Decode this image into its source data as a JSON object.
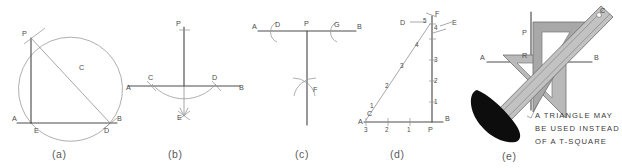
{
  "figure": {
    "title_note": "A TRIANGLE MAY BE USED INSTEAD OF A T-SQUARE",
    "background_color": "#ffffff",
    "line_color": "#4d4d4d",
    "construction_color": "#9a9a9a"
  },
  "panels": [
    {
      "id": "a",
      "caption": "(a)",
      "method": "semicircle-inscribed-right-angle",
      "labels": [
        {
          "key": "P",
          "text": "P"
        },
        {
          "key": "C",
          "text": "C"
        },
        {
          "key": "A",
          "text": "A"
        },
        {
          "key": "E",
          "text": "E"
        },
        {
          "key": "D",
          "text": "D"
        },
        {
          "key": "B",
          "text": "B"
        }
      ]
    },
    {
      "id": "b",
      "caption": "(b)",
      "method": "arc-bisector-through-point",
      "labels": [
        {
          "key": "P",
          "text": "P"
        },
        {
          "key": "A",
          "text": "A"
        },
        {
          "key": "C",
          "text": "C"
        },
        {
          "key": "D",
          "text": "D"
        },
        {
          "key": "B",
          "text": "B"
        },
        {
          "key": "E",
          "text": "E"
        }
      ]
    },
    {
      "id": "c",
      "caption": "(c)",
      "method": "equal-arcs-perpendicular-at-point",
      "labels": [
        {
          "key": "A",
          "text": "A"
        },
        {
          "key": "D",
          "text": "D"
        },
        {
          "key": "P",
          "text": "P"
        },
        {
          "key": "G",
          "text": "G"
        },
        {
          "key": "B",
          "text": "B"
        },
        {
          "key": "F",
          "text": "F"
        }
      ]
    },
    {
      "id": "d",
      "caption": "(d)",
      "method": "3-4-5-triangle-units",
      "labels": [
        {
          "key": "F",
          "text": "F"
        },
        {
          "key": "D",
          "text": "D"
        },
        {
          "key": "E",
          "text": "E"
        },
        {
          "key": "A",
          "text": "A"
        },
        {
          "key": "C",
          "text": "C"
        },
        {
          "key": "P",
          "text": "P"
        },
        {
          "key": "B",
          "text": "B"
        }
      ],
      "vertical_units": [
        "1",
        "2",
        "3",
        "4",
        "5"
      ],
      "horizontal_units": [
        "1",
        "2",
        "3"
      ],
      "hypotenuse_units": [
        "1",
        "2",
        "3",
        "4",
        "5"
      ]
    },
    {
      "id": "e",
      "caption": "(e)",
      "method": "triangle-and-straightedge",
      "labels": [
        {
          "key": "P",
          "text": "P"
        },
        {
          "key": "R",
          "text": "R"
        },
        {
          "key": "A",
          "text": "A"
        },
        {
          "key": "B",
          "text": "B"
        },
        {
          "key": "C",
          "text": "C"
        }
      ],
      "note_lines": [
        "A TRIANGLE MAY",
        "BE USED INSTEAD",
        "OF A T-SQUARE"
      ]
    }
  ]
}
